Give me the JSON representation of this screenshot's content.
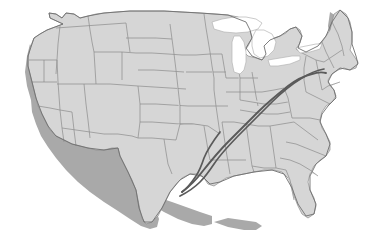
{
  "figure": {
    "kind": "map",
    "title": "United States map with two highlighted transportation corridors",
    "width": 371,
    "height": 240,
    "background_color": "#ffffff"
  },
  "map": {
    "region": "Contiguous United States",
    "projection_style": "flat raised relief with drop shadow",
    "land_fill_color": "#d6d6d6",
    "state_border_color": "#8b8b8b",
    "national_outline_color": "#6f6f6f",
    "shadow_color": "#a9a9a9",
    "water_fill_color": "#ffffff",
    "water_bodies": [
      "Lake Superior",
      "Lake Michigan",
      "Lake Huron",
      "Lake Erie",
      "Lake Ontario"
    ],
    "state_borders_visible": true,
    "labels_visible": false,
    "legend_visible": false,
    "scale_bar_visible": false,
    "compass_visible": false
  },
  "overlay": {
    "color": "#5a5a5a",
    "line_count": 2,
    "description": "Two near-parallel dark corridor lines crossing the eastern United States diagonally",
    "routes": [
      {
        "name": "corridor-north",
        "southwest_terminus": "Gulf Coast near Texas / Louisiana border",
        "northeast_terminus": "New York / New Jersey metropolitan area",
        "bearing": "southwest to northeast",
        "stroke_width_px": 1.9
      },
      {
        "name": "corridor-south",
        "southwest_terminus": "Gulf Coast near Texas / Louisiana border",
        "northeast_terminus": "New York / New Jersey metropolitan area",
        "bearing": "southwest to northeast",
        "stroke_width_px": 1.7
      }
    ]
  }
}
